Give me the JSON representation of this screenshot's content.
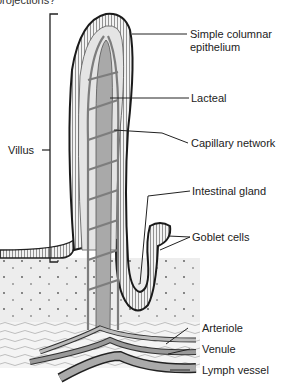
{
  "caption": "projections?",
  "figure": {
    "bracket_label": "Villus",
    "labels": [
      {
        "id": "simple-columnar-epithelium",
        "text_line1": "Simple columnar",
        "text_line2": "epithelium"
      },
      {
        "id": "lacteal",
        "text_line1": "Lacteal"
      },
      {
        "id": "capillary-network",
        "text_line1": "Capillary network"
      },
      {
        "id": "intestinal-gland",
        "text_line1": "Intestinal gland"
      },
      {
        "id": "goblet-cells",
        "text_line1": "Goblet cells"
      },
      {
        "id": "arteriole",
        "text_line1": "Arteriole"
      },
      {
        "id": "venule",
        "text_line1": "Venule"
      },
      {
        "id": "lymph-vessel",
        "text_line1": "Lymph vessel"
      }
    ]
  },
  "colors": {
    "epithelium": "#2a2a2a",
    "connective": "#e6e6e6",
    "lacteal": "#a8a8a8",
    "capillary": "#8a8a8a",
    "submucosa": "#ececec",
    "leader": "#222222"
  }
}
